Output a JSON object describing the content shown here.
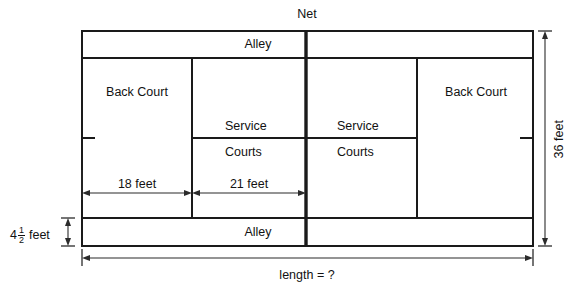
{
  "diagram": {
    "net_label": "Net",
    "alley_top_label": "Alley",
    "alley_bottom_label": "Alley",
    "back_court_left_label": "Back Court",
    "back_court_right_label": "Back Court",
    "service_left_line1": "Service",
    "service_left_line2": "Courts",
    "service_right_line1": "Service",
    "service_right_line2": "Courts",
    "dimensions": {
      "back_court_depth": "18 feet",
      "service_court_depth": "21 feet",
      "width_label": "36 feet",
      "alley_width_whole": "4",
      "alley_width_num": "1",
      "alley_width_den": "2",
      "alley_width_unit": "feet",
      "length_label": "length = ?"
    },
    "colors": {
      "line": "#1a1a1a",
      "dimension": "#2b2b2b",
      "background": "#ffffff",
      "text": "#121212"
    }
  }
}
